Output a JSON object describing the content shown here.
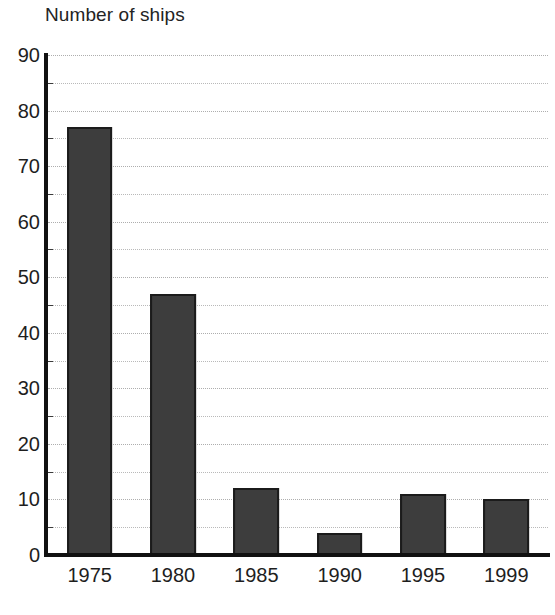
{
  "chart_data": {
    "type": "bar",
    "title": "Number of ships",
    "xlabel": "",
    "ylabel": "Number of ships",
    "categories": [
      "1975",
      "1980",
      "1985",
      "1990",
      "1995",
      "1999"
    ],
    "values": [
      77,
      47,
      12,
      4,
      11,
      10
    ],
    "ylim": [
      0,
      90
    ],
    "y_major_ticks": [
      0,
      10,
      20,
      30,
      40,
      50,
      60,
      70,
      80,
      90
    ],
    "y_minor_gridlines": [
      5,
      15,
      25,
      35,
      45,
      55,
      65,
      75,
      85
    ],
    "y_tick_labels": [
      "0",
      "10",
      "20",
      "30",
      "40",
      "50",
      "60",
      "70",
      "80",
      "90"
    ],
    "grid": true,
    "grid_style": "dotted-horizontal",
    "legend": null,
    "legend_position": "none",
    "series": [
      {
        "name": "Number of ships",
        "values": [
          77,
          47,
          12,
          4,
          11,
          10
        ]
      }
    ],
    "colors": {
      "bar_fill": "#3d3d3d",
      "bar_outline": "#1b1b1b",
      "axis": "#111111",
      "gridline": "#b9b9b9",
      "text": "#1e1e1e",
      "background": "#ffffff"
    }
  }
}
